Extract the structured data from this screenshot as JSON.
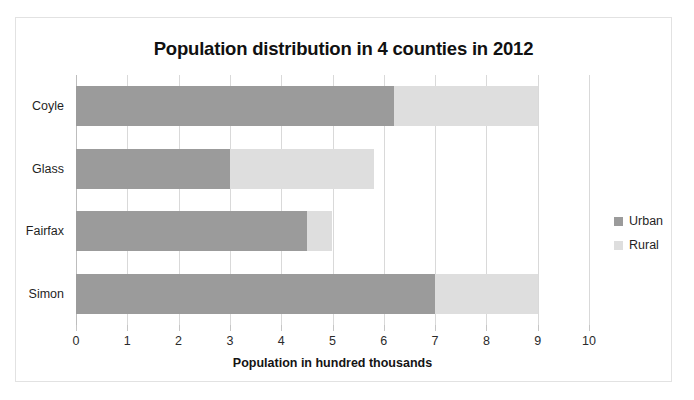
{
  "chart_data": {
    "type": "bar",
    "orientation": "horizontal",
    "stacked": true,
    "title": "Population distribution in 4 counties in 2012",
    "xlabel": "Population in hundred thousands",
    "ylabel": "",
    "xlim": [
      0,
      10
    ],
    "xticks": [
      "0",
      "1",
      "2",
      "3",
      "4",
      "5",
      "6",
      "7",
      "8",
      "9",
      "10"
    ],
    "grid": true,
    "legend_position": "right",
    "categories": [
      "Coyle",
      "Glass",
      "Fairfax",
      "Simon"
    ],
    "series": [
      {
        "name": "Urban",
        "color": "#9b9b9b",
        "values": [
          6.2,
          3.0,
          4.5,
          7.0
        ]
      },
      {
        "name": "Rural",
        "color": "#dedede",
        "values": [
          2.8,
          2.8,
          0.5,
          2.0
        ]
      }
    ],
    "totals": [
      9.0,
      5.8,
      5.0,
      9.0
    ]
  }
}
